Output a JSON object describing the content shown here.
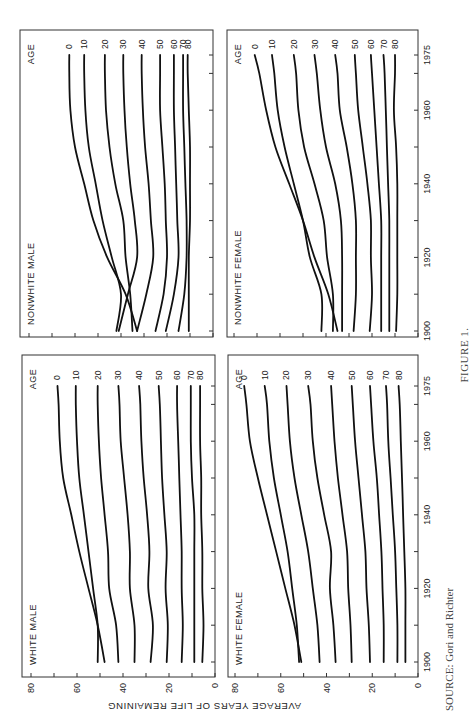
{
  "figure": {
    "caption": "FIGURE 1.",
    "source": "SOURCE: Gori and Richter",
    "ylabel": "AVERAGE YEARS OF LIFE REMAINING",
    "age_legend_title": "AGE"
  },
  "chart_data": [
    {
      "type": "line",
      "title": "WHITE MALE",
      "xlabel": "Year",
      "ylabel": "AVERAGE YEARS OF LIFE REMAINING",
      "x_ticks": [
        1900,
        1920,
        1940,
        1960,
        1975
      ],
      "y_ticks": [
        0,
        20,
        40,
        60,
        80
      ],
      "ylim": [
        0,
        80
      ],
      "xlim": [
        1900,
        1975
      ],
      "x": [
        1900,
        1910,
        1920,
        1930,
        1940,
        1950,
        1960,
        1970,
        1975
      ],
      "legend_title": "AGE",
      "series": [
        {
          "name": "0",
          "values": [
            48,
            51,
            55,
            59,
            62.5,
            66,
            67.5,
            68,
            68.5
          ]
        },
        {
          "name": "10",
          "values": [
            51,
            51,
            53,
            55,
            57,
            59,
            60,
            60.5,
            60.5
          ]
        },
        {
          "name": "20",
          "values": [
            42,
            43,
            46,
            46.5,
            48,
            49.5,
            50.5,
            51,
            51
          ]
        },
        {
          "name": "30",
          "values": [
            35,
            35,
            37,
            37,
            38,
            39.5,
            41,
            41.5,
            42
          ]
        },
        {
          "name": "40",
          "values": [
            28,
            27,
            29,
            28.5,
            29.5,
            31,
            32,
            32.5,
            33
          ]
        },
        {
          "name": "50",
          "values": [
            21,
            20.5,
            21.5,
            21,
            22,
            23,
            23.5,
            24,
            24.5
          ]
        },
        {
          "name": "60",
          "values": [
            14.5,
            14,
            14.5,
            14.5,
            15,
            15.5,
            16,
            16.5,
            16.5
          ]
        },
        {
          "name": "70",
          "values": [
            9,
            9,
            9,
            9,
            9,
            10,
            10.5,
            10.5,
            10.5
          ]
        },
        {
          "name": "80",
          "values": [
            5.5,
            5,
            5.5,
            5.5,
            6,
            6,
            6.5,
            6.5,
            6.5
          ]
        }
      ]
    },
    {
      "type": "line",
      "title": "NONWHITE MALE",
      "xlabel": "Year",
      "ylabel": "AVERAGE YEARS OF LIFE REMAINING",
      "x_ticks": [
        1900,
        1920,
        1940,
        1960,
        1975
      ],
      "y_ticks": [
        0,
        20,
        40,
        60,
        80
      ],
      "ylim": [
        0,
        80
      ],
      "xlim": [
        1900,
        1975
      ],
      "x": [
        1900,
        1910,
        1920,
        1930,
        1940,
        1950,
        1960,
        1970,
        1975
      ],
      "legend_title": "AGE",
      "series": [
        {
          "name": "0",
          "values": [
            33,
            38,
            46,
            52,
            56,
            60,
            62,
            62.5,
            62.5
          ]
        },
        {
          "name": "10",
          "values": [
            42,
            40,
            44,
            48,
            51,
            54,
            55.5,
            56,
            56
          ]
        },
        {
          "name": "20",
          "values": [
            35,
            36,
            38,
            39,
            42.5,
            45,
            46.5,
            47,
            47
          ]
        },
        {
          "name": "30",
          "values": [
            41,
            37,
            33,
            34,
            36,
            37.5,
            38.5,
            39,
            39
          ]
        },
        {
          "name": "40",
          "values": [
            33,
            29,
            26,
            27,
            28,
            29.5,
            30.5,
            31,
            31
          ]
        },
        {
          "name": "50",
          "values": [
            25,
            21.5,
            20,
            20.5,
            21,
            22,
            23,
            23,
            23
          ]
        },
        {
          "name": "60",
          "values": [
            20.5,
            17,
            15,
            15.5,
            16,
            16.5,
            17,
            17,
            17
          ]
        },
        {
          "name": "70",
          "values": [
            15,
            12.5,
            11.5,
            11.5,
            12,
            12.5,
            13,
            13,
            13
          ]
        },
        {
          "name": "80",
          "values": [
            10.5,
            10.5,
            10.5,
            10,
            10,
            10,
            10.5,
            11,
            11
          ]
        }
      ]
    },
    {
      "type": "line",
      "title": "WHITE FEMALE",
      "xlabel": "Year",
      "ylabel": "AVERAGE YEARS OF LIFE REMAINING",
      "x_ticks": [
        1900,
        1920,
        1940,
        1960,
        1975
      ],
      "y_ticks": [
        0,
        20,
        40,
        60,
        80
      ],
      "ylim": [
        0,
        80
      ],
      "xlim": [
        1900,
        1975
      ],
      "x": [
        1900,
        1910,
        1920,
        1930,
        1940,
        1950,
        1960,
        1970,
        1975
      ],
      "legend_title": "AGE",
      "series": [
        {
          "name": "0",
          "values": [
            51,
            54,
            58,
            62,
            66,
            70,
            73.5,
            75,
            76
          ]
        },
        {
          "name": "10",
          "values": [
            52,
            53,
            55,
            57,
            60,
            63,
            65,
            66,
            67
          ]
        },
        {
          "name": "20",
          "values": [
            43,
            44,
            46,
            48,
            51,
            54,
            56,
            57,
            57.5
          ]
        },
        {
          "name": "30",
          "values": [
            36,
            37,
            38.5,
            38,
            41,
            44,
            46,
            47,
            48
          ]
        },
        {
          "name": "40",
          "values": [
            29,
            29.5,
            30.5,
            31,
            33,
            35,
            36.5,
            37.5,
            38
          ]
        },
        {
          "name": "50",
          "values": [
            21,
            21.5,
            22.5,
            23,
            24.5,
            26,
            27.5,
            28.5,
            29
          ]
        },
        {
          "name": "60",
          "values": [
            15,
            15,
            15.5,
            16,
            17,
            18,
            19.5,
            20.5,
            21
          ]
        },
        {
          "name": "70",
          "values": [
            9,
            9,
            9.5,
            10,
            11,
            12,
            13,
            13.5,
            14
          ]
        },
        {
          "name": "80",
          "values": [
            5.5,
            5.5,
            5.5,
            6,
            6.5,
            7,
            7.5,
            8,
            8.5
          ]
        }
      ]
    },
    {
      "type": "line",
      "title": "NONWHITE FEMALE",
      "xlabel": "Year",
      "ylabel": "AVERAGE YEARS OF LIFE REMAINING",
      "x_ticks": [
        1900,
        1920,
        1940,
        1960,
        1975
      ],
      "y_ticks": [
        0,
        20,
        40,
        60,
        80
      ],
      "ylim": [
        0,
        80
      ],
      "xlim": [
        1900,
        1975
      ],
      "x": [
        1900,
        1910,
        1920,
        1930,
        1940,
        1950,
        1960,
        1970,
        1975
      ],
      "legend_title": "AGE",
      "series": [
        {
          "name": "0",
          "values": [
            35,
            39,
            45,
            50,
            56,
            62,
            66,
            69,
            71
          ]
        },
        {
          "name": "10",
          "values": [
            42,
            42,
            47,
            50,
            54,
            58,
            61,
            62.5,
            63.5
          ]
        },
        {
          "name": "20",
          "values": [
            37,
            37,
            39.5,
            41,
            45,
            49.5,
            52,
            53,
            54
          ]
        },
        {
          "name": "30",
          "values": [
            33,
            33,
            33,
            33.5,
            36,
            40,
            42.5,
            44,
            45
          ]
        },
        {
          "name": "40",
          "values": [
            28,
            27,
            27,
            27,
            28.5,
            31,
            34,
            35,
            36
          ]
        },
        {
          "name": "50",
          "values": [
            21,
            20,
            20.5,
            20.5,
            22,
            24,
            26,
            27,
            27.5
          ]
        },
        {
          "name": "60",
          "values": [
            16,
            16,
            16,
            16,
            17,
            18,
            19,
            20,
            20.5
          ]
        },
        {
          "name": "70",
          "values": [
            12.5,
            12.5,
            12.5,
            12.5,
            13,
            13.5,
            14,
            14.5,
            15
          ]
        },
        {
          "name": "80",
          "values": [
            9.5,
            9,
            9,
            9,
            9,
            9.5,
            10.5,
            10,
            10
          ]
        }
      ]
    }
  ],
  "layout": {
    "panels": [
      {
        "key": "WHITE MALE",
        "chart_index": 0,
        "x0": 22,
        "x1": 215,
        "y_top": 355,
        "y_bot": 677,
        "v80": 31,
        "v0": 215,
        "yr1900": 662,
        "yr1975": 386
      },
      {
        "key": "NONWHITE MALE",
        "chart_index": 1,
        "x0": 20,
        "x1": 213,
        "y_top": 30,
        "y_bot": 337,
        "v80": 29,
        "v0": 213,
        "yr1900": 331,
        "yr1975": 55
      },
      {
        "key": "WHITE FEMALE",
        "chart_index": 2,
        "x0": 228,
        "x1": 418,
        "y_top": 355,
        "y_bot": 677,
        "v80": 235,
        "v0": 418,
        "yr1900": 662,
        "yr1975": 386
      },
      {
        "key": "NONWHITE FEMALE",
        "chart_index": 3,
        "x0": 227,
        "x1": 418,
        "y_top": 30,
        "y_bot": 337,
        "v80": 234,
        "v0": 418,
        "yr1900": 331,
        "yr1975": 55
      }
    ]
  }
}
